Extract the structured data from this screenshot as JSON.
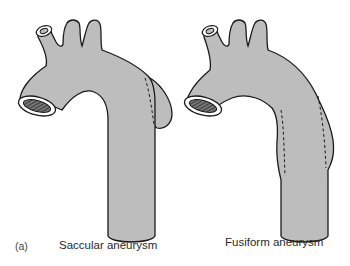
{
  "figure": {
    "panel_label": "(a)",
    "colors": {
      "vessel_fill": "#bdbdbd",
      "outline": "#1a1a1a",
      "lumen": "#555555",
      "background": "#ffffff"
    },
    "diagrams": [
      {
        "id": "saccular",
        "caption": "Saccular aneurysm",
        "description": "Aortic arch with a sac-like outpouching on one side of the descending aorta, boundary shown as dashed line"
      },
      {
        "id": "fusiform",
        "caption": "Fusiform aneurysm",
        "description": "Aortic arch with circumferential spindle-shaped dilatation of the descending aorta, original wall shown as dashed lines on both sides"
      }
    ]
  }
}
